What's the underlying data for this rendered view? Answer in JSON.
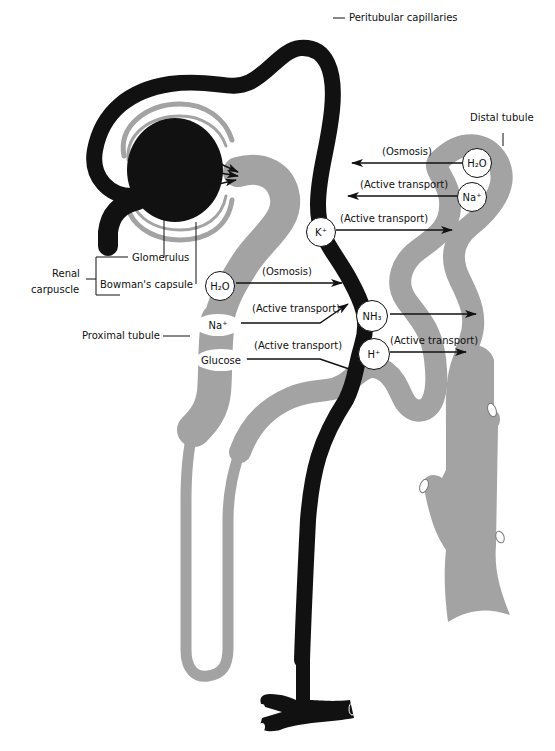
{
  "figure": {
    "colors": {
      "capillary": "#111111",
      "tubule": "#a3a3a3",
      "background": "#ffffff",
      "text": "#111111"
    }
  },
  "structure_labels": {
    "peritubular_capillaries": "Peritubular capillaries",
    "distal_tubule": "Distal tubule",
    "glomerulus": "Glomerulus",
    "bowmans_capsule": "Bowman's capsule",
    "renal_carpuscle_line1": "Renal",
    "renal_carpuscle_line2": "carpuscle",
    "proximal_tubule": "Proximal tubule"
  },
  "distal_exchanges": [
    {
      "ion": "H₂O",
      "process": "(Osmosis)",
      "direction": "to-capillary"
    },
    {
      "ion": "Na⁺",
      "process": "(Active transport)",
      "direction": "to-capillary"
    },
    {
      "ion": "K⁺",
      "process": "(Active transport)",
      "direction": "to-tubule"
    }
  ],
  "proximal_exchanges": [
    {
      "ion": "H₂O",
      "process": "(Osmosis)",
      "direction": "to-capillary"
    },
    {
      "ion": "Na⁺",
      "process": "(Active transport)",
      "direction": "to-capillary"
    },
    {
      "ion": "Glucose",
      "process": "(Active transport)",
      "direction": "to-capillary"
    }
  ],
  "secretions": [
    {
      "ion": "NH₃",
      "process": "",
      "direction": "to-tubule"
    },
    {
      "ion": "H⁺",
      "process": "(Active transport)",
      "direction": "to-tubule"
    }
  ]
}
